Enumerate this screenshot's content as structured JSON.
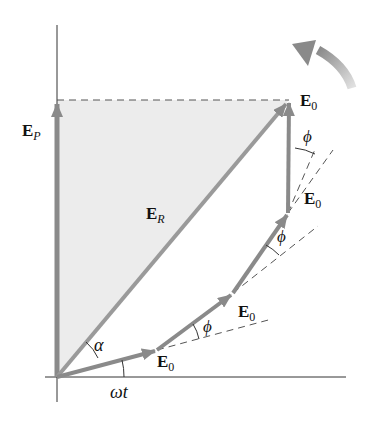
{
  "diagram": {
    "colors": {
      "phasor": "#8a8a8a",
      "resultant": "#9a9a9a",
      "shading": "#ececec",
      "axis": "#333333",
      "dashed": "#555555",
      "rotation_arrow": "#9c9c9c"
    },
    "labels": {
      "ep_main": "E",
      "ep_sub": "P",
      "er_main": "E",
      "er_sub": "R",
      "e0_main": "E",
      "e0_sub": "0",
      "alpha": "α",
      "phi": "ϕ",
      "omega_t": "ωt"
    },
    "phasors": [
      {
        "name": "phasor-1",
        "from": [
          57,
          377
        ],
        "to": [
          157,
          350
        ],
        "label": "E0"
      },
      {
        "name": "phasor-2",
        "from": [
          157,
          350
        ],
        "to": [
          233,
          293
        ],
        "label": "E0"
      },
      {
        "name": "phasor-3",
        "from": [
          233,
          293
        ],
        "to": [
          288,
          213
        ],
        "label": "E0"
      },
      {
        "name": "phasor-4",
        "from": [
          288,
          213
        ],
        "to": [
          289,
          100
        ],
        "label": "E0"
      }
    ],
    "resultant": {
      "from": [
        57,
        377
      ],
      "to": [
        289,
        100
      ],
      "label": "ER"
    },
    "projection": {
      "from": [
        57,
        377
      ],
      "to": [
        57,
        100
      ],
      "label": "EP"
    },
    "angles": [
      "ωt",
      "α",
      "ϕ",
      "ϕ",
      "ϕ",
      "ϕ"
    ],
    "rotation_direction": "counterclockwise"
  }
}
